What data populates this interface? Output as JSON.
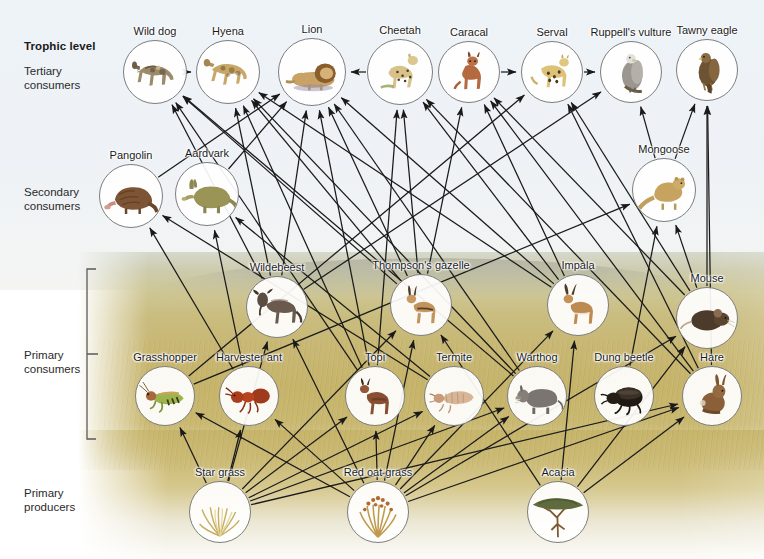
{
  "figure": {
    "trophic_header": "Trophic level",
    "levels": [
      {
        "id": "tertiary",
        "label": "Tertiary\nconsumers"
      },
      {
        "id": "secondary",
        "label": "Secondary\nconsumers"
      },
      {
        "id": "primary",
        "label": "Primary\nconsumers"
      },
      {
        "id": "producers",
        "label": "Primary\nproducers"
      }
    ]
  },
  "colors": {
    "arrow": "#1a1a1a",
    "circle_stroke": "#7d7d7d",
    "text": "#1b1b1b",
    "sky": "#eef3f7",
    "grass": "#c6b46a",
    "hill": "#b0b2a0"
  },
  "organisms": [
    {
      "id": "wild_dog",
      "label": "Wild dog",
      "level": "tertiary",
      "cx": 155,
      "cy": 72,
      "r": 32
    },
    {
      "id": "hyena",
      "label": "Hyena",
      "level": "tertiary",
      "cx": 228,
      "cy": 72,
      "r": 32
    },
    {
      "id": "lion",
      "label": "Lion",
      "level": "tertiary",
      "cx": 312,
      "cy": 72,
      "r": 34
    },
    {
      "id": "cheetah",
      "label": "Cheetah",
      "level": "tertiary",
      "cx": 400,
      "cy": 72,
      "r": 33
    },
    {
      "id": "caracal",
      "label": "Caracal",
      "level": "tertiary",
      "cx": 469,
      "cy": 72,
      "r": 31
    },
    {
      "id": "serval",
      "label": "Serval",
      "level": "tertiary",
      "cx": 552,
      "cy": 72,
      "r": 31
    },
    {
      "id": "ruppells_vulture",
      "label": "Ruppell's vulture",
      "level": "tertiary",
      "cx": 631,
      "cy": 72,
      "r": 31
    },
    {
      "id": "tawny_eagle",
      "label": "Tawny eagle",
      "level": "tertiary",
      "cx": 707,
      "cy": 70,
      "r": 31
    },
    {
      "id": "pangolin",
      "label": "Pangolin",
      "level": "secondary",
      "cx": 131,
      "cy": 196,
      "r": 32
    },
    {
      "id": "aardvark",
      "label": "Aardvark",
      "level": "secondary",
      "cx": 207,
      "cy": 194,
      "r": 32
    },
    {
      "id": "mongoose",
      "label": "Mongoose",
      "level": "secondary",
      "cx": 664,
      "cy": 190,
      "r": 32
    },
    {
      "id": "wildebeest",
      "label": "Wildebeest",
      "level": "primary",
      "cx": 277,
      "cy": 307,
      "r": 31
    },
    {
      "id": "thompsons_gazelle",
      "label": "Thompson's gazelle",
      "level": "primary",
      "cx": 421,
      "cy": 305,
      "r": 31
    },
    {
      "id": "impala",
      "label": "Impala",
      "level": "primary",
      "cx": 578,
      "cy": 305,
      "r": 31
    },
    {
      "id": "mouse",
      "label": "Mouse",
      "level": "primary",
      "cx": 707,
      "cy": 318,
      "r": 31
    },
    {
      "id": "grasshopper",
      "label": "Grasshopper",
      "level": "primary",
      "cx": 165,
      "cy": 396,
      "r": 30
    },
    {
      "id": "harvester_ant",
      "label": "Harvester ant",
      "level": "primary",
      "cx": 249,
      "cy": 396,
      "r": 30
    },
    {
      "id": "topi",
      "label": "Topi",
      "level": "primary",
      "cx": 375,
      "cy": 396,
      "r": 30
    },
    {
      "id": "termite",
      "label": "Termite",
      "level": "primary",
      "cx": 454,
      "cy": 396,
      "r": 30
    },
    {
      "id": "warthog",
      "label": "Warthog",
      "level": "primary",
      "cx": 537,
      "cy": 396,
      "r": 30
    },
    {
      "id": "dung_beetle",
      "label": "Dung beetle",
      "level": "primary",
      "cx": 624,
      "cy": 396,
      "r": 30
    },
    {
      "id": "hare",
      "label": "Hare",
      "level": "primary",
      "cx": 712,
      "cy": 396,
      "r": 30
    },
    {
      "id": "star_grass",
      "label": "Star grass",
      "level": "producers",
      "cx": 220,
      "cy": 512,
      "r": 31
    },
    {
      "id": "red_oat_grass",
      "label": "Red oat grass",
      "level": "producers",
      "cx": 378,
      "cy": 512,
      "r": 31
    },
    {
      "id": "acacia",
      "label": "Acacia",
      "level": "producers",
      "cx": 558,
      "cy": 512,
      "r": 31
    }
  ],
  "feeding_links": [
    {
      "from": "star_grass",
      "to": "grasshopper"
    },
    {
      "from": "star_grass",
      "to": "harvester_ant"
    },
    {
      "from": "star_grass",
      "to": "topi"
    },
    {
      "from": "star_grass",
      "to": "termite"
    },
    {
      "from": "star_grass",
      "to": "warthog"
    },
    {
      "from": "star_grass",
      "to": "wildebeest"
    },
    {
      "from": "star_grass",
      "to": "thompsons_gazelle"
    },
    {
      "from": "star_grass",
      "to": "hare"
    },
    {
      "from": "red_oat_grass",
      "to": "grasshopper"
    },
    {
      "from": "red_oat_grass",
      "to": "harvester_ant"
    },
    {
      "from": "red_oat_grass",
      "to": "topi"
    },
    {
      "from": "red_oat_grass",
      "to": "termite"
    },
    {
      "from": "red_oat_grass",
      "to": "warthog"
    },
    {
      "from": "red_oat_grass",
      "to": "wildebeest"
    },
    {
      "from": "red_oat_grass",
      "to": "thompsons_gazelle"
    },
    {
      "from": "red_oat_grass",
      "to": "impala"
    },
    {
      "from": "red_oat_grass",
      "to": "mouse"
    },
    {
      "from": "red_oat_grass",
      "to": "hare"
    },
    {
      "from": "acacia",
      "to": "impala"
    },
    {
      "from": "acacia",
      "to": "thompsons_gazelle"
    },
    {
      "from": "acacia",
      "to": "mouse"
    },
    {
      "from": "acacia",
      "to": "hare"
    },
    {
      "from": "termite",
      "to": "pangolin"
    },
    {
      "from": "termite",
      "to": "aardvark"
    },
    {
      "from": "harvester_ant",
      "to": "pangolin"
    },
    {
      "from": "harvester_ant",
      "to": "aardvark"
    },
    {
      "from": "grasshopper",
      "to": "mongoose"
    },
    {
      "from": "grasshopper",
      "to": "serval"
    },
    {
      "from": "dung_beetle",
      "to": "mongoose"
    },
    {
      "from": "mouse",
      "to": "mongoose"
    },
    {
      "from": "mouse",
      "to": "serval"
    },
    {
      "from": "mouse",
      "to": "tawny_eagle"
    },
    {
      "from": "mouse",
      "to": "caracal"
    },
    {
      "from": "wildebeest",
      "to": "lion"
    },
    {
      "from": "wildebeest",
      "to": "hyena"
    },
    {
      "from": "wildebeest",
      "to": "wild_dog"
    },
    {
      "from": "wildebeest",
      "to": "ruppells_vulture"
    },
    {
      "from": "topi",
      "to": "lion"
    },
    {
      "from": "topi",
      "to": "hyena"
    },
    {
      "from": "topi",
      "to": "cheetah"
    },
    {
      "from": "topi",
      "to": "wild_dog"
    },
    {
      "from": "thompsons_gazelle",
      "to": "lion"
    },
    {
      "from": "thompsons_gazelle",
      "to": "cheetah"
    },
    {
      "from": "thompsons_gazelle",
      "to": "hyena"
    },
    {
      "from": "thompsons_gazelle",
      "to": "wild_dog"
    },
    {
      "from": "thompsons_gazelle",
      "to": "caracal"
    },
    {
      "from": "impala",
      "to": "lion"
    },
    {
      "from": "impala",
      "to": "cheetah"
    },
    {
      "from": "impala",
      "to": "caracal"
    },
    {
      "from": "impala",
      "to": "hyena"
    },
    {
      "from": "warthog",
      "to": "lion"
    },
    {
      "from": "warthog",
      "to": "hyena"
    },
    {
      "from": "warthog",
      "to": "wild_dog"
    },
    {
      "from": "hare",
      "to": "caracal"
    },
    {
      "from": "hare",
      "to": "serval"
    },
    {
      "from": "hare",
      "to": "tawny_eagle"
    },
    {
      "from": "hare",
      "to": "cheetah"
    },
    {
      "from": "mongoose",
      "to": "tawny_eagle"
    },
    {
      "from": "mongoose",
      "to": "ruppells_vulture"
    },
    {
      "from": "pangolin",
      "to": "lion"
    },
    {
      "from": "aardvark",
      "to": "lion"
    },
    {
      "from": "cheetah",
      "to": "lion"
    },
    {
      "from": "wild_dog",
      "to": "hyena"
    },
    {
      "from": "serval",
      "to": "ruppells_vulture"
    },
    {
      "from": "caracal",
      "to": "serval"
    }
  ],
  "chart_data": {
    "type": "diagram",
    "levels": [
      "Primary producers",
      "Primary consumers",
      "Secondary consumers",
      "Tertiary consumers"
    ],
    "node_count": 25,
    "link_count": 62
  }
}
